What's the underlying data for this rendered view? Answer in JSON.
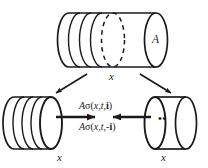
{
  "figure": {
    "colors": {
      "stroke": "#1a1a1a",
      "background": "#ffffff",
      "fill": "#ffffff"
    },
    "top_cylinder": {
      "name": "whole-control-volume",
      "area_label": "A",
      "axis_label": "x"
    },
    "split_arrows": {
      "left_arrow_name": "split-arrow-left",
      "right_arrow_name": "split-arrow-right"
    },
    "left_cylinder": {
      "name": "left-subvolume",
      "axis_label": "x"
    },
    "right_cylinder": {
      "name": "right-subvolume",
      "axis_label": "x",
      "ellipsis": "••"
    },
    "flux_labels": {
      "upper": {
        "prefix": "A",
        "sigma": "σ",
        "args_open": "(",
        "arg_x": "x",
        "comma1": ",",
        "arg_t": "t",
        "comma2": ",",
        "arg_n": "i",
        "args_close": ")",
        "full": "Aσ(x,t,i)"
      },
      "lower": {
        "prefix": "A",
        "sigma": "σ",
        "args_open": "(",
        "arg_x": "x",
        "comma1": ",",
        "arg_t": "t",
        "comma2": ",",
        "minus": "-",
        "arg_n": "i",
        "args_close": ")",
        "full": "Aσ(x,t,-i)"
      }
    },
    "traction_arrows": {
      "right_pointing_name": "traction-arrow-right",
      "left_pointing_name": "traction-arrow-left"
    }
  }
}
